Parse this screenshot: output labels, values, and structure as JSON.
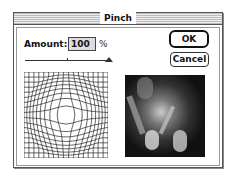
{
  "dialog": {
    "title": "Pinch",
    "amount_label": "Amount:",
    "amount_value": "100",
    "amount_unit": "%",
    "slider": {
      "value": 100,
      "min": -100,
      "max": 100
    },
    "buttons": {
      "ok_label": "OK",
      "cancel_label": "Cancel"
    },
    "previews": {
      "grid": "grid-distortion-preview",
      "image": "tiger-image-preview"
    }
  }
}
